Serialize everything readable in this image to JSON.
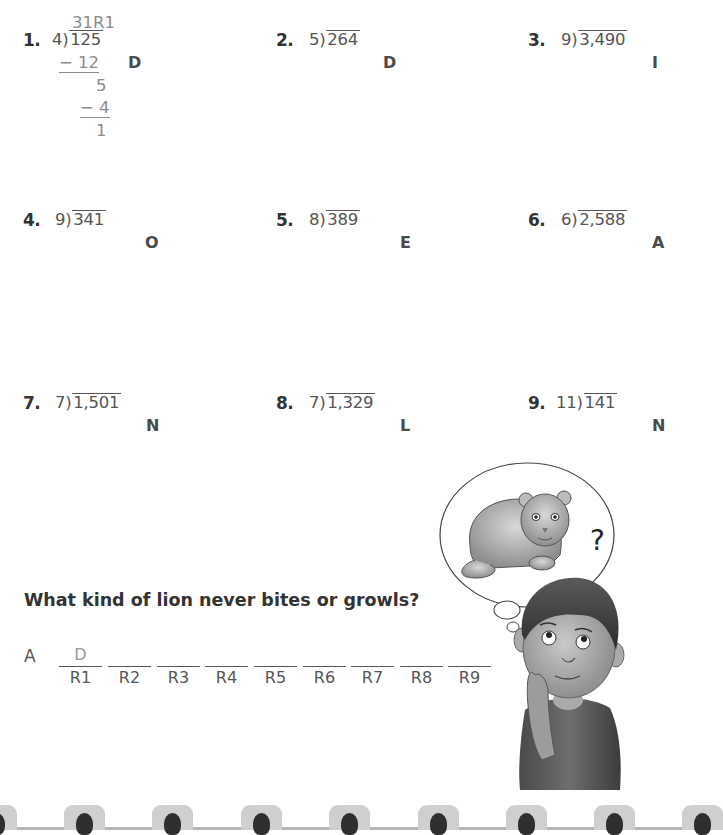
{
  "problems": [
    {
      "number": "1.",
      "divisor": "4",
      "dividend": "125",
      "code_letter": "D",
      "worked_example": {
        "quotient": "31R1",
        "steps": [
          "− 12",
          "5",
          "− 4",
          "1"
        ]
      }
    },
    {
      "number": "2.",
      "divisor": "5",
      "dividend": "264",
      "code_letter": "D"
    },
    {
      "number": "3.",
      "divisor": "9",
      "dividend": "3,490",
      "code_letter": "I"
    },
    {
      "number": "4.",
      "divisor": "9",
      "dividend": "341",
      "code_letter": "O"
    },
    {
      "number": "5.",
      "divisor": "8",
      "dividend": "389",
      "code_letter": "E"
    },
    {
      "number": "6.",
      "divisor": "6",
      "dividend": "2,588",
      "code_letter": "A"
    },
    {
      "number": "7.",
      "divisor": "7",
      "dividend": "1,501",
      "code_letter": "N"
    },
    {
      "number": "8.",
      "divisor": "7",
      "dividend": "1,329",
      "code_letter": "L"
    },
    {
      "number": "9.",
      "divisor": "11",
      "dividend": "141",
      "code_letter": "N"
    }
  ],
  "riddle": {
    "question": "What kind of lion never bites or growls?",
    "answer_prefix": "A",
    "blanks": [
      {
        "label": "R1",
        "filled": "D"
      },
      {
        "label": "R2",
        "filled": ""
      },
      {
        "label": "R3",
        "filled": ""
      },
      {
        "label": "R4",
        "filled": ""
      },
      {
        "label": "R5",
        "filled": ""
      },
      {
        "label": "R6",
        "filled": ""
      },
      {
        "label": "R7",
        "filled": ""
      },
      {
        "label": "R8",
        "filled": ""
      },
      {
        "label": "R9",
        "filled": ""
      }
    ]
  },
  "illustration": {
    "thought_bubble_symbol": "?",
    "description": "Boy thinking about a lion cub"
  },
  "colors": {
    "text_dark": "#333333",
    "text_worked": "#8c8c8c",
    "binder_tab": "#cfcfcf",
    "binder_hole": "#2f2f2f"
  }
}
